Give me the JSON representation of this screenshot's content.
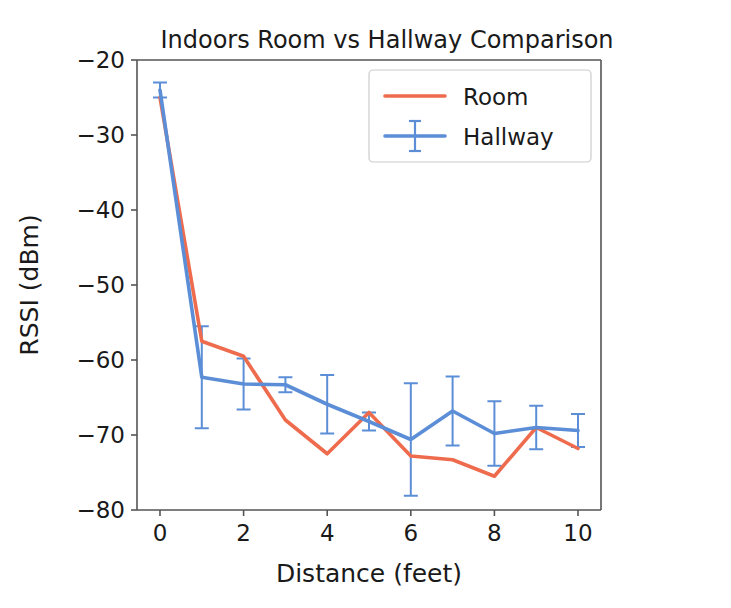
{
  "chart_data": {
    "type": "line",
    "title": "Indoors Room vs Hallway Comparison",
    "xlabel": "Distance (feet)",
    "ylabel": "RSSI (dBm)",
    "x": [
      0,
      1,
      2,
      3,
      4,
      5,
      6,
      7,
      8,
      9,
      10
    ],
    "xlim": [
      -0.55,
      10.55
    ],
    "ylim": [
      -80,
      -20
    ],
    "xticks": [
      0,
      2,
      4,
      6,
      8,
      10
    ],
    "xtick_labels": [
      "0",
      "2",
      "4",
      "6",
      "8",
      "10"
    ],
    "yticks": [
      -20,
      -30,
      -40,
      -50,
      -60,
      -70,
      -80
    ],
    "ytick_labels": [
      "−20",
      "−30",
      "−40",
      "−50",
      "−60",
      "−70",
      "−80"
    ],
    "grid": false,
    "legend_position": "upper right",
    "series": [
      {
        "name": "Room",
        "color": "#ee6c4d",
        "has_errorbars": false,
        "values": [
          -25.0,
          -57.5,
          -59.5,
          -68.0,
          -72.5,
          -67.0,
          -72.8,
          -73.3,
          -75.5,
          -69.0,
          -71.8
        ],
        "errors": [
          0,
          0,
          0,
          0,
          0,
          0,
          0,
          0,
          0,
          0,
          0
        ]
      },
      {
        "name": "Hallway",
        "color": "#5b8ed6",
        "has_errorbars": true,
        "values": [
          -24.0,
          -62.3,
          -63.2,
          -63.3,
          -65.9,
          -68.2,
          -70.6,
          -66.8,
          -69.8,
          -69.0,
          -69.4
        ],
        "errors": [
          1.0,
          6.8,
          3.4,
          1.0,
          3.9,
          1.2,
          7.5,
          4.6,
          4.3,
          2.9,
          2.2
        ]
      }
    ]
  },
  "legend": {
    "entries": [
      {
        "label": "Room",
        "color": "#ee6c4d",
        "marker": "line"
      },
      {
        "label": "Hallway",
        "color": "#5b8ed6",
        "marker": "errorbar"
      }
    ]
  },
  "colors": {
    "room": "#ee6c4d",
    "hallway": "#5b8ed6",
    "axis": "#555555",
    "text": "#1a1a1a",
    "background": "#ffffff"
  }
}
